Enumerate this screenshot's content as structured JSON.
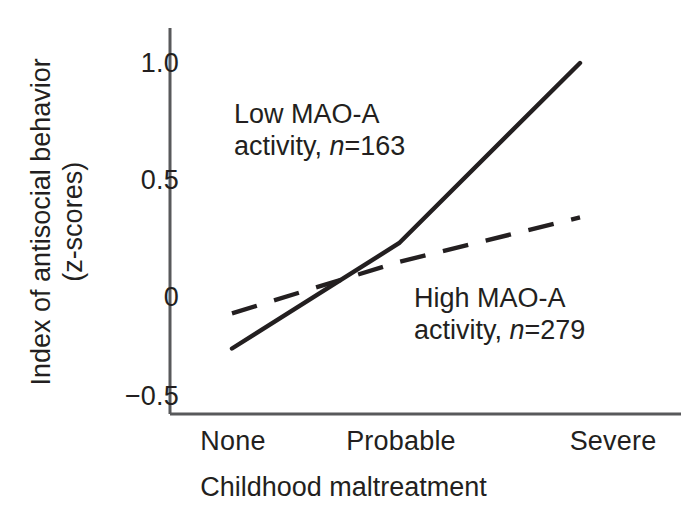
{
  "figure": {
    "background_color": "#ffffff",
    "ink_color": "#231f20",
    "axis_color": "#58595b"
  },
  "axes": {
    "y": {
      "title_line1": "Index of antisocial behavior",
      "title_line2": "(z-scores)",
      "ticks": [
        "1.0",
        "0.5",
        "0",
        "−0.5"
      ],
      "tick_values": [
        1.0,
        0.5,
        0,
        -0.5
      ],
      "range": [
        -0.5,
        1.1
      ]
    },
    "x": {
      "title": "Childhood maltreatment",
      "ticks": [
        "None",
        "Probable",
        "Severe"
      ]
    }
  },
  "series_labels": {
    "low": {
      "line1": "Low MAO-A",
      "line2_prefix": "activity, ",
      "line2_italic": "n",
      "line2_suffix": "=163"
    },
    "high": {
      "line1": "High MAO-A",
      "line2_prefix": "activity, ",
      "line2_italic": "n",
      "line2_suffix": "=279"
    }
  },
  "chart_data": {
    "type": "line",
    "title": "",
    "xlabel": "Childhood maltreatment",
    "ylabel": "Index of antisocial behavior (z-scores)",
    "categories": [
      "None",
      "Probable",
      "Severe"
    ],
    "ylim": [
      -0.5,
      1.1
    ],
    "yticks": [
      -0.5,
      0,
      0.5,
      1.0
    ],
    "ytick_labels": [
      "−0.5",
      "0",
      "0.5",
      "1.0"
    ],
    "grid": false,
    "legend_position": "inline-annotations",
    "series": [
      {
        "name": "Low MAO-A activity, n=163",
        "n": 163,
        "style": "solid",
        "color": "#231f20",
        "values": [
          -0.22,
          0.23,
          1.0
        ]
      },
      {
        "name": "High MAO-A activity, n=279",
        "n": 279,
        "style": "dashed",
        "color": "#231f20",
        "values": [
          -0.07,
          0.15,
          0.34
        ]
      }
    ]
  }
}
